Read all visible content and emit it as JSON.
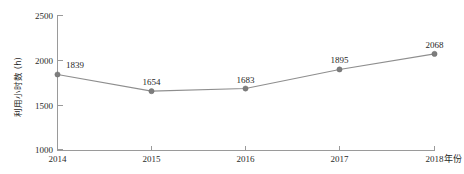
{
  "chart_data": {
    "type": "line",
    "title": "",
    "subtitle": "",
    "xlabel": "年份",
    "ylabel": "利用小时数 (h)",
    "categories": [
      "2014",
      "2015",
      "2016",
      "2017",
      "2018"
    ],
    "values": [
      1839,
      1654,
      1683,
      1895,
      2068
    ],
    "series": [
      {
        "name": "利用小时数",
        "values": [
          1839,
          1654,
          1683,
          1895,
          2068
        ]
      }
    ],
    "point_labels": [
      "1839",
      "1654",
      "1683",
      "1895",
      "2068"
    ],
    "ylim": [
      1000,
      2500
    ],
    "yticks": [
      1000,
      1500,
      2000,
      2500
    ],
    "ytick_labels": [
      "1000",
      "1500",
      "2000",
      "2500"
    ],
    "xtick_labels": [
      "2014",
      "2015",
      "2016",
      "2017",
      "2018"
    ],
    "grid": false,
    "legend": "none",
    "marker": "circle",
    "colors": {
      "line": "#8e8e8e",
      "marker": "#7d7d7d",
      "axis": "#9a9a9a",
      "text": "#1f1f1f",
      "background": "#ffffff"
    }
  }
}
